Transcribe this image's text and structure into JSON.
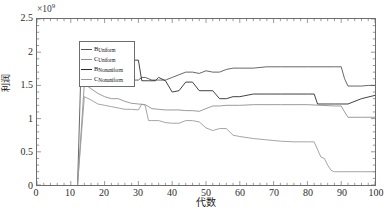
{
  "chart_data": {
    "type": "line",
    "title": "",
    "xlabel": "代数",
    "ylabel": "利润",
    "y_exponent_base": "×10",
    "y_exponent_power": "9",
    "xlim": [
      0,
      100
    ],
    "ylim": [
      0,
      2.5
    ],
    "grid": false,
    "legend_position": "upper-left",
    "xticks": [
      0,
      10,
      20,
      30,
      40,
      50,
      60,
      70,
      80,
      90,
      100
    ],
    "yticks": [
      0,
      0.5,
      1,
      1.5,
      2,
      2.5
    ],
    "xtick_labels": [
      "0",
      "10",
      "20",
      "30",
      "40",
      "50",
      "60",
      "70",
      "80",
      "90",
      "100"
    ],
    "ytick_labels": [
      "0",
      "0.5",
      "1",
      "1.5",
      "2",
      "2.5"
    ],
    "series": [
      {
        "name": "B_Uniform",
        "label_main": "B",
        "label_sub": "Uniform",
        "color": "#555555",
        "x": [
          12,
          13,
          14,
          16,
          18,
          20,
          21,
          22,
          23,
          24,
          25,
          26,
          28,
          30,
          31,
          32,
          34,
          36,
          38,
          40,
          42,
          44,
          46,
          48,
          50,
          52,
          54,
          56,
          58,
          60,
          64,
          68,
          72,
          76,
          80,
          84,
          88,
          90,
          91,
          92,
          94,
          96,
          98,
          100
        ],
        "values": [
          0,
          1.74,
          1.74,
          1.73,
          1.7,
          1.62,
          1.6,
          1.66,
          1.62,
          1.58,
          1.63,
          1.6,
          1.58,
          1.58,
          1.62,
          1.62,
          1.58,
          1.58,
          1.58,
          1.62,
          1.66,
          1.7,
          1.7,
          1.68,
          1.72,
          1.7,
          1.7,
          1.74,
          1.76,
          1.76,
          1.76,
          1.78,
          1.78,
          1.78,
          1.78,
          1.78,
          1.78,
          1.78,
          1.6,
          1.49,
          1.49,
          1.49,
          1.5,
          1.5
        ]
      },
      {
        "name": "C_Uniform",
        "label_main": "C",
        "label_sub": "Uniform",
        "color": "#8f8f8f",
        "x": [
          12,
          14,
          16,
          18,
          20,
          22,
          24,
          26,
          28,
          30,
          32,
          34,
          36,
          38,
          40,
          42,
          44,
          46,
          48,
          50,
          52,
          54,
          56,
          60,
          64,
          68,
          72,
          76,
          80,
          84,
          88,
          90,
          91,
          92,
          96,
          100
        ],
        "values": [
          0,
          1.52,
          1.45,
          1.38,
          1.33,
          1.3,
          1.3,
          1.26,
          1.23,
          1.22,
          1.21,
          1.15,
          1.14,
          1.13,
          1.13,
          1.13,
          1.12,
          1.12,
          1.11,
          1.15,
          1.19,
          1.19,
          1.2,
          1.2,
          1.21,
          1.21,
          1.21,
          1.21,
          1.21,
          1.2,
          1.19,
          1.19,
          1.1,
          1.02,
          1.02,
          1.02
        ]
      },
      {
        "name": "B_Nonuniform",
        "label_main": "B",
        "label_sub": "Nonuniform",
        "color": "#2b2b2b",
        "x": [
          20,
          21,
          22,
          23,
          24,
          25,
          26,
          27,
          28,
          29,
          30,
          31,
          32,
          33,
          34,
          35,
          36,
          38,
          40,
          42,
          44,
          46,
          48,
          50,
          52,
          54,
          56,
          58,
          60,
          64,
          68,
          72,
          76,
          80,
          82,
          83,
          84,
          88,
          92,
          96,
          100
        ],
        "values": [
          2.0,
          2.02,
          1.99,
          1.96,
          2.05,
          1.93,
          1.88,
          1.88,
          1.88,
          1.88,
          1.88,
          1.57,
          1.57,
          1.57,
          1.57,
          1.57,
          1.62,
          1.57,
          1.4,
          1.42,
          1.55,
          1.55,
          1.42,
          1.42,
          1.42,
          1.3,
          1.3,
          1.33,
          1.33,
          1.37,
          1.37,
          1.37,
          1.37,
          1.37,
          1.37,
          1.22,
          1.22,
          1.22,
          1.22,
          1.3,
          1.35
        ]
      },
      {
        "name": "C_Nonuniform",
        "label_main": "C",
        "label_sub": "Nonuniform",
        "color": "#9a9a9a",
        "x": [
          12,
          14,
          16,
          18,
          20,
          22,
          24,
          26,
          28,
          30,
          31,
          32,
          33,
          34,
          36,
          38,
          40,
          42,
          44,
          46,
          48,
          50,
          52,
          54,
          56,
          58,
          60,
          64,
          68,
          72,
          76,
          80,
          82,
          84,
          85,
          86,
          87,
          88,
          90,
          92,
          96,
          100
        ],
        "values": [
          0,
          1.33,
          1.28,
          1.22,
          1.2,
          1.18,
          1.16,
          1.14,
          1.14,
          1.13,
          1.22,
          1.2,
          0.97,
          0.97,
          0.97,
          0.94,
          0.93,
          0.93,
          0.97,
          0.97,
          0.95,
          0.86,
          0.82,
          0.85,
          0.85,
          0.75,
          0.73,
          0.7,
          0.68,
          0.66,
          0.65,
          0.65,
          0.65,
          0.42,
          0.4,
          0.3,
          0.22,
          0.2,
          0.2,
          0.2,
          0.2,
          0.2
        ]
      }
    ]
  }
}
